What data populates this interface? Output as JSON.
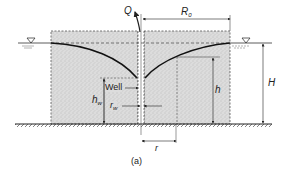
{
  "diagram": {
    "caption": "(a)",
    "labels": {
      "discharge": "Q",
      "radius_of_influence": "R",
      "radius_of_influence_sub": "0",
      "well": "Well",
      "well_head": "h",
      "well_head_sub": "w",
      "well_radius": "r",
      "well_radius_sub": "w",
      "head": "h",
      "initial_head": "H",
      "radial_distance": "r"
    },
    "symbols": {
      "water_table_marker": "▽"
    },
    "colors": {
      "soil": "#d9d9d9",
      "line": "#222222",
      "background": "#ffffff"
    }
  }
}
